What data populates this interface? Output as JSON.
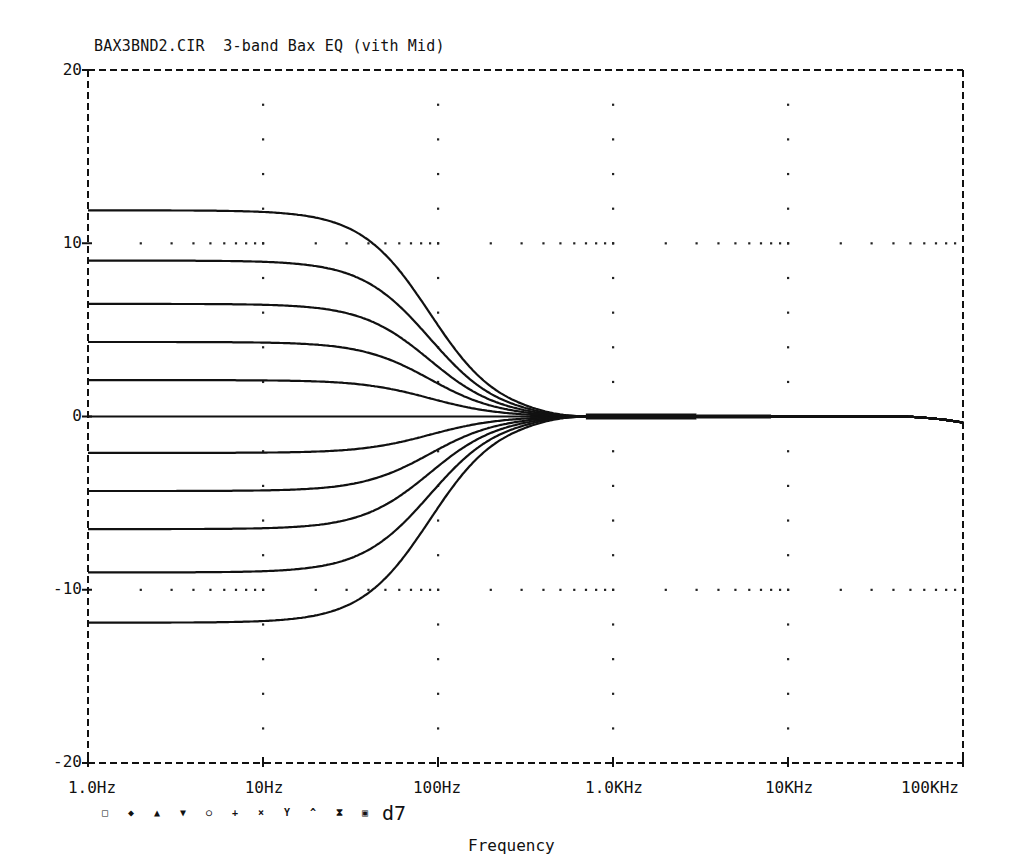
{
  "chart_data": {
    "type": "line",
    "title": "BAX3BND2.CIR  3-band Bax EQ (vith Mid)",
    "xlabel": "Frequency",
    "ylabel": "",
    "xscale": "log",
    "xlim": [
      1,
      100000
    ],
    "ylim": [
      -20,
      20
    ],
    "x_tick_labels": [
      "1.0Hz",
      "10Hz",
      "100Hz",
      "1.0KHz",
      "10KHz",
      "100KHz"
    ],
    "x_tick_values": [
      1,
      10,
      100,
      1000,
      10000,
      100000
    ],
    "y_tick_labels": [
      "20",
      "10",
      "0",
      "-10",
      "-20"
    ],
    "y_tick_values": [
      20,
      10,
      0,
      -10,
      -20
    ],
    "grid": "dotted at decades and at ±10 dB",
    "legend": {
      "markers": [
        "□",
        "◆",
        "▲",
        "▼",
        "○",
        "+",
        "×",
        "Y",
        "^",
        "⧗",
        "▣"
      ],
      "label": "d7"
    },
    "shelf_corner_hz": 90,
    "converge_hz": 480,
    "series": [
      {
        "name": "bass +12",
        "low_freq_db": 11.9
      },
      {
        "name": "bass +9",
        "low_freq_db": 9.0
      },
      {
        "name": "bass +6.5",
        "low_freq_db": 6.5
      },
      {
        "name": "bass +4.3",
        "low_freq_db": 4.3
      },
      {
        "name": "bass +2.1",
        "low_freq_db": 2.1
      },
      {
        "name": "bass 0",
        "low_freq_db": 0.0
      },
      {
        "name": "bass -2.1",
        "low_freq_db": -2.1
      },
      {
        "name": "bass -4.3",
        "low_freq_db": -4.3
      },
      {
        "name": "bass -6.5",
        "low_freq_db": -6.5
      },
      {
        "name": "bass -9",
        "low_freq_db": -9.0
      },
      {
        "name": "bass -12",
        "low_freq_db": -11.9
      }
    ],
    "high_freq_db": 0,
    "sample_points_note": "each curve flat at low_freq_db below ~20Hz, transitions through ~100Hz, converges to 0 dB at ~480Hz, flat 0 dB up to 100KHz"
  }
}
